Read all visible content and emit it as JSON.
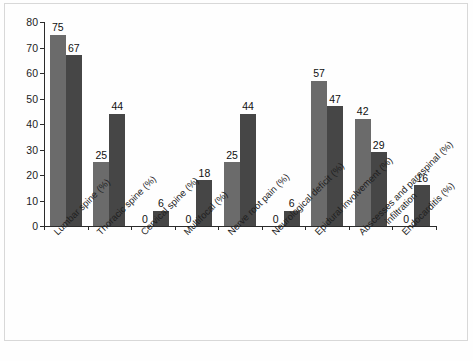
{
  "chart_data": {
    "type": "bar",
    "title": "",
    "subtitle": "",
    "xlabel": "",
    "ylabel": "",
    "ylim": [
      0,
      80
    ],
    "yticks": [
      0,
      10,
      20,
      30,
      40,
      50,
      60,
      70,
      80
    ],
    "grid": false,
    "legend": "none",
    "categories": [
      "Lumbar spine (%)",
      "Thoracic spine (%)",
      "Cervical spine (%)",
      "Multifocal (%)",
      "Nerve root pain (%)",
      "Neurological deficit (%)",
      "Epidural involvement (%)",
      "Abscesses and paraspinal infiltration (%)",
      "Endocarditis (%)"
    ],
    "category_lines": [
      [
        "Lumbar spine (%)"
      ],
      [
        "Thoracic spine (%)"
      ],
      [
        "Cervical spine (%)"
      ],
      [
        "Multifocal (%)"
      ],
      [
        "Nerve root pain (%)"
      ],
      [
        "Neurological deficit (%)"
      ],
      [
        "Epidural involvement (%)"
      ],
      [
        "Abscesses and paraspinal (%)",
        "infiltration"
      ],
      [
        "Endocarditis (%)"
      ]
    ],
    "series": [
      {
        "name": "Series 1",
        "color": "#6b6b6b",
        "values": [
          75,
          25,
          0,
          0,
          25,
          0,
          57,
          42,
          0
        ]
      },
      {
        "name": "Series 2",
        "color": "#464646",
        "values": [
          67,
          44,
          6,
          18,
          44,
          6,
          47,
          29,
          16
        ]
      }
    ],
    "value_labels": {
      "series1": [
        "75",
        "25",
        "0",
        "0",
        "25",
        "0",
        "57",
        "42",
        "0"
      ],
      "series2": [
        "67",
        "44",
        "6",
        "18",
        "44",
        "6",
        "47",
        "29",
        "16"
      ]
    },
    "colors": {
      "series1": "#6b6b6b",
      "series2": "#464646",
      "axis": "#2b2b2b",
      "text": "#1c1c1c",
      "background": "#ffffff",
      "frame": "#d8d8d8"
    }
  }
}
